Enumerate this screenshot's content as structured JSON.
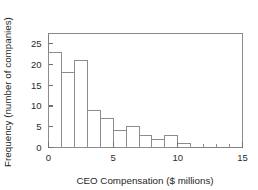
{
  "chart_data": {
    "type": "bar",
    "title": "",
    "subtitle": "",
    "xlabel": "CEO Compensation ($ millions)",
    "ylabel": "Frequency (number of companies)",
    "xlim": [
      0,
      15
    ],
    "ylim": [
      0,
      27.5
    ],
    "grid": false,
    "legend": false,
    "legend_position": "none",
    "bin_width": 1,
    "bin_edges": [
      0,
      1,
      2,
      3,
      4,
      5,
      6,
      7,
      8,
      9,
      10,
      11
    ],
    "categories": [
      "0-1",
      "1-2",
      "2-3",
      "3-4",
      "4-5",
      "5-6",
      "6-7",
      "7-8",
      "8-9",
      "9-10",
      "10-11"
    ],
    "values": [
      23,
      18,
      21,
      9,
      7,
      4,
      5,
      3,
      2,
      3,
      1
    ],
    "x_ticks_major": [
      0,
      5,
      10,
      15
    ],
    "x_tick_labels": [
      "0",
      "5",
      "10",
      "15"
    ],
    "x_ticks_minor": [
      1,
      2,
      3,
      4,
      6,
      7,
      8,
      9,
      11,
      12,
      13,
      14
    ],
    "y_ticks_major": [
      0,
      5,
      10,
      15,
      20,
      25
    ],
    "y_tick_labels": [
      "0",
      "5",
      "10",
      "15",
      "20",
      "25"
    ],
    "colors": {
      "bar_fill": "#ffffff",
      "bar_stroke": "#8c8c8c",
      "axis": "#808080",
      "frame": "#8a8a8a",
      "text": "#1f1f1f",
      "background": "#ffffff"
    }
  }
}
